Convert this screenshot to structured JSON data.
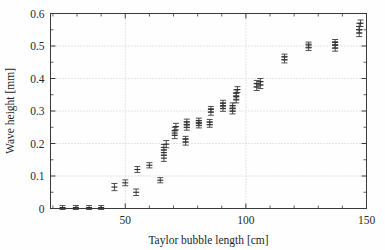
{
  "figure": {
    "background_color": "#ffffff",
    "ink_color": "#333333",
    "grid_color": "#b9b9b9"
  },
  "chart_data": {
    "type": "scatter",
    "title": "",
    "xlabel": "Taylor bubble length [cm]",
    "ylabel": "Wave height [mm]",
    "xlim": [
      19,
      150
    ],
    "ylim": [
      0,
      0.6
    ],
    "xticks": [
      50,
      100,
      150
    ],
    "xticklabels": [
      "50",
      "100",
      "150"
    ],
    "yticks": [
      0,
      0.1,
      0.2,
      0.3,
      0.4,
      0.5,
      0.6
    ],
    "yticklabels": [
      "0",
      "0.1",
      "0.2",
      "0.3",
      "0.4",
      "0.5",
      "0.6"
    ],
    "x_minor_tick_step": 10,
    "y_minor_tick_step": 0.05,
    "grid": true,
    "grid_axis": "both",
    "grid_style": "dotted",
    "legend": "none",
    "error_bars": "y",
    "marker": "horizontal-cap",
    "series": [
      {
        "name": "wave height vs Taylor bubble length",
        "color": "#333333",
        "points": [
          {
            "x": 24.0,
            "y": 0.003,
            "yerr": 0.006
          },
          {
            "x": 29.5,
            "y": 0.003,
            "yerr": 0.006
          },
          {
            "x": 35.0,
            "y": 0.003,
            "yerr": 0.006
          },
          {
            "x": 40.0,
            "y": 0.003,
            "yerr": 0.006
          },
          {
            "x": 45.5,
            "y": 0.066,
            "yerr": 0.011
          },
          {
            "x": 50.0,
            "y": 0.079,
            "yerr": 0.009
          },
          {
            "x": 54.5,
            "y": 0.05,
            "yerr": 0.01
          },
          {
            "x": 55.0,
            "y": 0.12,
            "yerr": 0.009
          },
          {
            "x": 60.0,
            "y": 0.133,
            "yerr": 0.008
          },
          {
            "x": 64.5,
            "y": 0.087,
            "yerr": 0.008
          },
          {
            "x": 66.0,
            "y": 0.155,
            "yerr": 0.01
          },
          {
            "x": 66.0,
            "y": 0.172,
            "yerr": 0.009
          },
          {
            "x": 66.0,
            "y": 0.188,
            "yerr": 0.009
          },
          {
            "x": 67.0,
            "y": 0.198,
            "yerr": 0.011
          },
          {
            "x": 70.5,
            "y": 0.225,
            "yerr": 0.01
          },
          {
            "x": 70.5,
            "y": 0.24,
            "yerr": 0.01
          },
          {
            "x": 71.0,
            "y": 0.252,
            "yerr": 0.01
          },
          {
            "x": 75.0,
            "y": 0.205,
            "yerr": 0.01
          },
          {
            "x": 75.0,
            "y": 0.213,
            "yerr": 0.009
          },
          {
            "x": 75.5,
            "y": 0.25,
            "yerr": 0.009
          },
          {
            "x": 75.5,
            "y": 0.258,
            "yerr": 0.009
          },
          {
            "x": 75.5,
            "y": 0.266,
            "yerr": 0.009
          },
          {
            "x": 80.5,
            "y": 0.256,
            "yerr": 0.008
          },
          {
            "x": 80.5,
            "y": 0.263,
            "yerr": 0.008
          },
          {
            "x": 80.5,
            "y": 0.27,
            "yerr": 0.008
          },
          {
            "x": 85.0,
            "y": 0.258,
            "yerr": 0.008
          },
          {
            "x": 85.0,
            "y": 0.266,
            "yerr": 0.008
          },
          {
            "x": 85.5,
            "y": 0.297,
            "yerr": 0.01
          },
          {
            "x": 85.5,
            "y": 0.305,
            "yerr": 0.009
          },
          {
            "x": 90.5,
            "y": 0.308,
            "yerr": 0.009
          },
          {
            "x": 90.5,
            "y": 0.316,
            "yerr": 0.009
          },
          {
            "x": 90.5,
            "y": 0.324,
            "yerr": 0.009
          },
          {
            "x": 94.5,
            "y": 0.3,
            "yerr": 0.009
          },
          {
            "x": 94.5,
            "y": 0.308,
            "yerr": 0.009
          },
          {
            "x": 94.5,
            "y": 0.316,
            "yerr": 0.009
          },
          {
            "x": 96.0,
            "y": 0.334,
            "yerr": 0.009
          },
          {
            "x": 96.0,
            "y": 0.345,
            "yerr": 0.009
          },
          {
            "x": 96.0,
            "y": 0.356,
            "yerr": 0.009
          },
          {
            "x": 96.5,
            "y": 0.366,
            "yerr": 0.009
          },
          {
            "x": 104.5,
            "y": 0.374,
            "yerr": 0.011
          },
          {
            "x": 104.5,
            "y": 0.384,
            "yerr": 0.01
          },
          {
            "x": 106.0,
            "y": 0.38,
            "yerr": 0.011
          },
          {
            "x": 106.0,
            "y": 0.39,
            "yerr": 0.01
          },
          {
            "x": 116.0,
            "y": 0.458,
            "yerr": 0.01
          },
          {
            "x": 116.0,
            "y": 0.466,
            "yerr": 0.009
          },
          {
            "x": 126.0,
            "y": 0.496,
            "yerr": 0.01
          },
          {
            "x": 126.0,
            "y": 0.503,
            "yerr": 0.009
          },
          {
            "x": 137.0,
            "y": 0.494,
            "yerr": 0.01
          },
          {
            "x": 137.0,
            "y": 0.503,
            "yerr": 0.01
          },
          {
            "x": 137.0,
            "y": 0.511,
            "yerr": 0.009
          },
          {
            "x": 147.0,
            "y": 0.54,
            "yerr": 0.011
          },
          {
            "x": 147.0,
            "y": 0.55,
            "yerr": 0.01
          },
          {
            "x": 147.0,
            "y": 0.56,
            "yerr": 0.01
          },
          {
            "x": 147.5,
            "y": 0.57,
            "yerr": 0.01
          }
        ]
      }
    ]
  }
}
